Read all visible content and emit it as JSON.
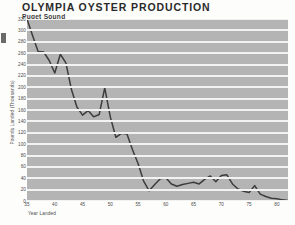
{
  "header": {
    "title": "OLYMPIA OYSTER PRODUCTION",
    "subtitle": "Puget Sound"
  },
  "axes": {
    "x_label": "Year Landed",
    "y_label": "Pounds Landed (Thousands)",
    "x_ticks": [
      "35",
      "40",
      "45",
      "50",
      "55",
      "60",
      "65",
      "70",
      "75",
      "80"
    ],
    "y_ticks": [
      "320",
      "300",
      "280",
      "260",
      "240",
      "220",
      "200",
      "180",
      "160",
      "140",
      "120",
      "100",
      "80",
      "60",
      "40",
      "20",
      "0"
    ]
  },
  "style": {
    "plot_background": "#b4b4b4",
    "gridline_color": "#f2f2f0",
    "line_color": "#3c3c3c",
    "page_background": "#fdfdfc"
  },
  "chart_data": {
    "type": "line",
    "title": "OLYMPIA OYSTER PRODUCTION",
    "subtitle": "Puget Sound",
    "xlabel": "Year Landed",
    "ylabel": "Pounds Landed (Thousands)",
    "xlim": [
      35,
      82
    ],
    "ylim": [
      0,
      320
    ],
    "y_tick_step": 20,
    "x_tick_step": 5,
    "grid": "horizontal",
    "legend": "none",
    "series": [
      {
        "name": "Pounds Landed (Thousands)",
        "x": [
          35,
          36,
          37,
          38,
          39,
          40,
          41,
          42,
          43,
          44,
          45,
          46,
          47,
          48,
          49,
          50,
          51,
          52,
          53,
          54,
          55,
          56,
          57,
          58,
          59,
          60,
          61,
          62,
          63,
          64,
          65,
          66,
          67,
          68,
          69,
          70,
          71,
          72,
          73,
          74,
          75,
          76,
          77,
          78,
          79,
          80,
          81,
          82
        ],
        "values": [
          320,
          291,
          263,
          262,
          247,
          225,
          258,
          243,
          196,
          165,
          151,
          159,
          148,
          152,
          199,
          148,
          112,
          119,
          118,
          90,
          66,
          35,
          18,
          29,
          39,
          41,
          30,
          26,
          29,
          31,
          33,
          30,
          38,
          44,
          34,
          45,
          46,
          30,
          21,
          17,
          15,
          27,
          12,
          8,
          5,
          4,
          2,
          1
        ]
      }
    ]
  }
}
